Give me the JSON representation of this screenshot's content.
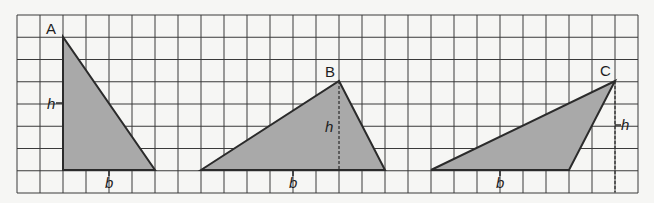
{
  "grid": {
    "left": 17,
    "top": 15,
    "cols": 27,
    "rows": 8,
    "cell_w": 23,
    "cell_h": 22.25,
    "line_color": "#3a3a3a"
  },
  "colors": {
    "fill": "#a9a9a9",
    "stroke": "#2b2b2b",
    "background": "#f6f6f4"
  },
  "triangles": [
    {
      "name": "A",
      "label": "A",
      "base_label": "b",
      "height_label": "h",
      "points": "63,37 63,170 155,170"
    },
    {
      "name": "B",
      "label": "B",
      "base_label": "b",
      "height_label": "h",
      "points": "201,170 339,81 385,170"
    },
    {
      "name": "C",
      "label": "C",
      "base_label": "b",
      "height_label": "h",
      "points": "431,170 615,81 569,170"
    }
  ]
}
